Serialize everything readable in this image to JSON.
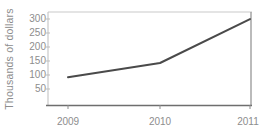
{
  "chart_data": {
    "type": "line",
    "title": "",
    "subtitle": "",
    "xlabel": "",
    "ylabel": "Thousands of dollars",
    "categories": [
      "2009",
      "2010",
      "2011"
    ],
    "x": [
      2009,
      2010,
      2011
    ],
    "values": [
      100,
      150,
      305
    ],
    "series": [
      {
        "name": "",
        "values": [
          100,
          150,
          305
        ]
      }
    ],
    "xtick_labels": [
      "2009",
      "2010",
      "2011"
    ],
    "ytick_labels": [
      "50",
      "100",
      "150",
      "200",
      "250",
      "300"
    ],
    "ytick_values": [
      50,
      100,
      150,
      200,
      250,
      300
    ],
    "ylim": [
      0,
      330
    ],
    "xlim": [
      2009,
      2011
    ],
    "grid": false,
    "legend": false,
    "legend_position": "none",
    "annotations": []
  },
  "style": {
    "line_color": "#4a4a4a",
    "axis_color": "#b7b7b7",
    "bottom_axis_color": "#6e6e6e",
    "tick_text_color": "#8d8d8d",
    "background_color": "#ffffff"
  }
}
